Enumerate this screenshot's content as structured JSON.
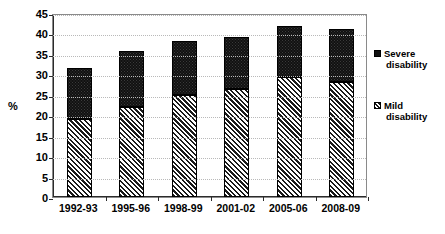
{
  "chart_data": {
    "type": "bar",
    "subtype": "stacked-bar",
    "title": "",
    "xlabel": "",
    "ylabel": "%",
    "ylim": [
      0,
      45
    ],
    "ytick_step": 5,
    "yticks": [
      45,
      40,
      35,
      30,
      25,
      20,
      15,
      10,
      5,
      0
    ],
    "grid": "horizontal-dotted",
    "legend_position": "right",
    "categories": [
      "1992-93",
      "1995-96",
      "1998-99",
      "2001-02",
      "2005-06",
      "2008-09"
    ],
    "series": [
      {
        "name": "Mild disability",
        "pattern": "diagonal-hatch",
        "color": "#ffffff",
        "values": [
          19.0,
          22.1,
          25.0,
          26.5,
          29.4,
          28.1
        ]
      },
      {
        "name": "Severe disability",
        "pattern": "dotted-black",
        "color": "#111111",
        "values": [
          12.6,
          13.7,
          13.1,
          12.7,
          12.4,
          13.1
        ]
      }
    ],
    "totals": [
      31.6,
      35.8,
      38.1,
      39.2,
      41.8,
      41.2
    ]
  },
  "legend": {
    "items": [
      {
        "label_line1": "Severe",
        "label_line2": "disability",
        "swatch": "severe-swatch-icon"
      },
      {
        "label_line1": "Mild",
        "label_line2": "disability",
        "swatch": "mild-swatch-icon"
      }
    ]
  },
  "axis": {
    "y_title": "%"
  }
}
